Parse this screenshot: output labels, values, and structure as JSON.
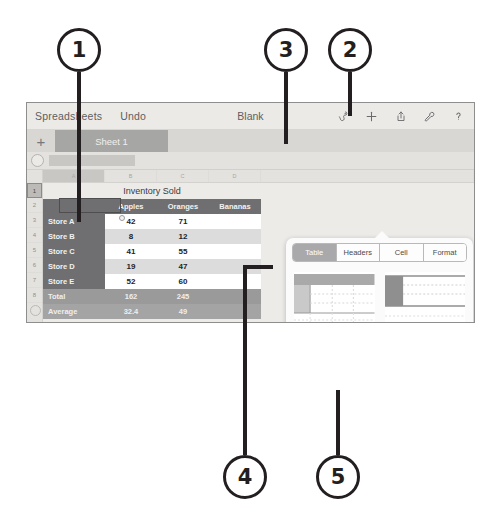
{
  "callouts": [
    {
      "n": "1"
    },
    {
      "n": "2"
    },
    {
      "n": "3"
    },
    {
      "n": "4"
    },
    {
      "n": "5"
    }
  ],
  "toolbar": {
    "app_label": "Spreadsheets",
    "undo_label": "Undo",
    "doc_title": "Blank",
    "icons": [
      {
        "name": "format-brush-icon",
        "glyph": "brush"
      },
      {
        "name": "insert-plus-icon",
        "glyph": "plus"
      },
      {
        "name": "share-icon",
        "glyph": "share"
      },
      {
        "name": "tools-wrench-icon",
        "glyph": "wrench"
      },
      {
        "name": "help-question-icon",
        "glyph": "question"
      }
    ]
  },
  "sheetbar": {
    "add_label": "+",
    "sheet_name": "Sheet 1"
  },
  "grid": {
    "column_headers": [
      "A",
      "B",
      "C",
      "D",
      ""
    ],
    "row_headers": [
      "1",
      "2",
      "3",
      "4",
      "5",
      "6",
      "7",
      "8"
    ],
    "title_cell": "Inventory Sold"
  },
  "table": {
    "header_row": [
      "",
      "Apples",
      "Oranges",
      "Bananas"
    ],
    "rows": [
      {
        "label": "Store A",
        "values": [
          "42",
          "71",
          ""
        ]
      },
      {
        "label": "Store B",
        "values": [
          "8",
          "12",
          ""
        ]
      },
      {
        "label": "Store C",
        "values": [
          "41",
          "55",
          ""
        ]
      },
      {
        "label": "Store D",
        "values": [
          "19",
          "47",
          ""
        ]
      },
      {
        "label": "Store E",
        "values": [
          "52",
          "60",
          ""
        ]
      }
    ],
    "footer_rows": [
      {
        "label": "Total",
        "values": [
          "162",
          "245",
          ""
        ]
      },
      {
        "label": "Average",
        "values": [
          "32.4",
          "49",
          ""
        ]
      }
    ]
  },
  "popover": {
    "tabs": [
      {
        "label": "Table",
        "active": true
      },
      {
        "label": "Headers",
        "active": false
      },
      {
        "label": "Cell",
        "active": false
      },
      {
        "label": "Format",
        "active": false
      }
    ],
    "styles": [
      {
        "id": "style-1",
        "selected": false
      },
      {
        "id": "style-2",
        "selected": false
      },
      {
        "id": "style-3",
        "selected": true
      },
      {
        "id": "style-4",
        "selected": false
      },
      {
        "id": "style-5",
        "selected": false
      },
      {
        "id": "style-6",
        "selected": false
      }
    ],
    "options_label": "Table Options",
    "options_chevron": "›"
  },
  "colors": {
    "header_gray": "#6f6f71",
    "footer_gray": "#9a9a9a",
    "band_gray": "#dcdcdc",
    "toolbar_bg": "#eceae6",
    "sheettab_bg": "#a6a6a4",
    "callout_stroke": "#231f20"
  }
}
